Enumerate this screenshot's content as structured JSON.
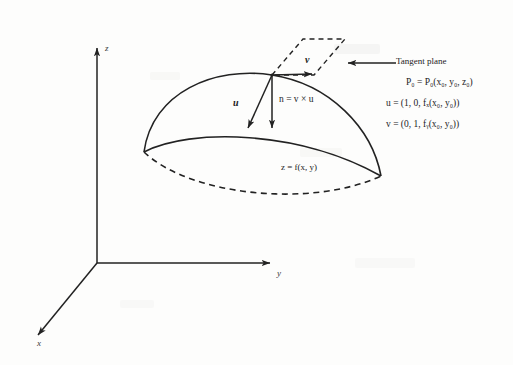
{
  "figure": {
    "type": "math-diagram"
  },
  "axes": {
    "z_label": "z",
    "y_label": "y",
    "x_label": "x"
  },
  "surface": {
    "equation": "z = f(x, y)"
  },
  "vectors": {
    "u_label": "u",
    "v_label": "v",
    "normal_equation": "n = v × u"
  },
  "annotations": {
    "tangent_plane": "Tangent plane",
    "point_line": "P₀ = P₀(x₀, y₀, z₀)",
    "u_line": "u = (1, 0, fₓ(x₀, y₀))",
    "v_line": "v = (0, 1, fᵧ(x₀, y₀))"
  },
  "colors": {
    "ink": "#1c1c1c",
    "paper": "#fdfdfc",
    "stroke": "#2a2a2a"
  }
}
